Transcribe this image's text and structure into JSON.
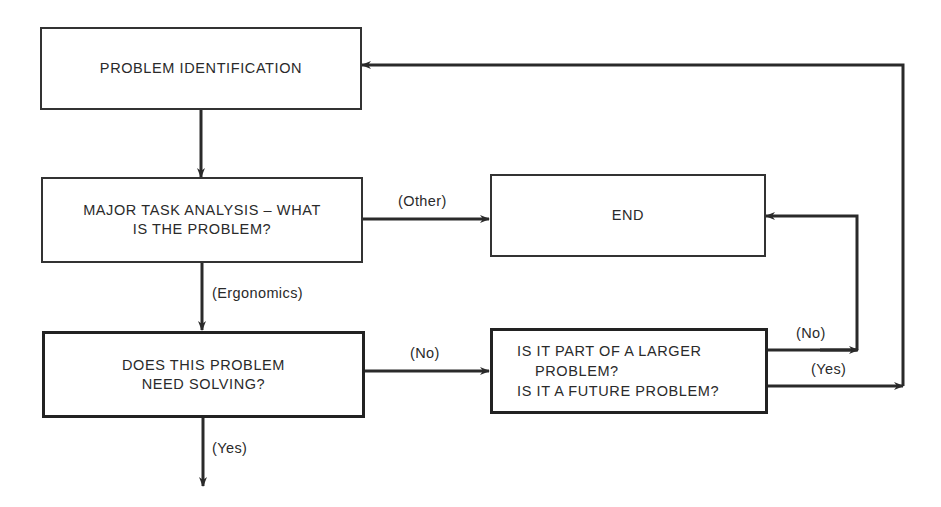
{
  "diagram": {
    "type": "flowchart",
    "nodes": {
      "problem_identification": {
        "text": "PROBLEM IDENTIFICATION"
      },
      "major_task_analysis": {
        "line1": "MAJOR TASK ANALYSIS – WHAT",
        "line2": "IS THE PROBLEM?"
      },
      "end": {
        "text": "END"
      },
      "needs_solving": {
        "line1": "DOES THIS PROBLEM",
        "line2": "NEED SOLVING?"
      },
      "larger_problem": {
        "line1": "IS IT PART OF A LARGER",
        "line2": "PROBLEM?",
        "line3": "IS IT A FUTURE PROBLEM?"
      }
    },
    "edge_labels": {
      "other": "(Other)",
      "ergonomics": "(Ergonomics)",
      "no_1": "(No)",
      "no_2": "(No)",
      "yes_1": "(Yes)",
      "yes_2": "(Yes)"
    },
    "edges": [
      {
        "from": "problem_identification",
        "to": "major_task_analysis",
        "label": ""
      },
      {
        "from": "major_task_analysis",
        "to": "end",
        "label": "(Other)"
      },
      {
        "from": "major_task_analysis",
        "to": "needs_solving",
        "label": "(Ergonomics)"
      },
      {
        "from": "needs_solving",
        "to": "larger_problem",
        "label": "(No)"
      },
      {
        "from": "needs_solving",
        "to": "continue",
        "label": "(Yes)"
      },
      {
        "from": "larger_problem",
        "to": "end",
        "label": "(No)"
      },
      {
        "from": "larger_problem",
        "to": "problem_identification",
        "label": "(Yes)"
      }
    ],
    "line_color": "#2a2a2a"
  }
}
